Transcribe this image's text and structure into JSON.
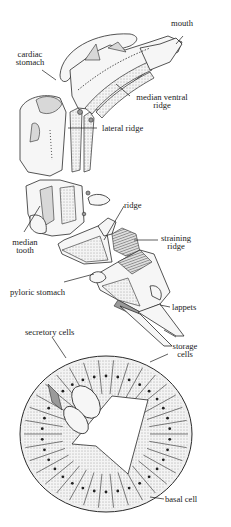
{
  "figure": {
    "labels": {
      "mouth": "mouth",
      "cardiac_stomach_1": "cardiac",
      "cardiac_stomach_2": "stomach",
      "median_ventral_ridge_1": "median ventral",
      "median_ventral_ridge_2": "ridge",
      "lateral_ridge": "lateral ridge",
      "median_tooth_1": "median",
      "median_tooth_2": "tooth",
      "ridge": "ridge",
      "straining_ridge_1": "straining",
      "straining_ridge_2": "ridge",
      "pyloric_stomach": "pyloric stomach",
      "lappets": "lappets",
      "secretory_cells": "secretory cells",
      "storage_cells_1": "storage",
      "storage_cells_2": "cells",
      "basal_cell": "basal cell"
    },
    "colors": {
      "ink": "#2a2a2a",
      "stipple": "#d8d8d8",
      "background": "#ffffff"
    }
  }
}
